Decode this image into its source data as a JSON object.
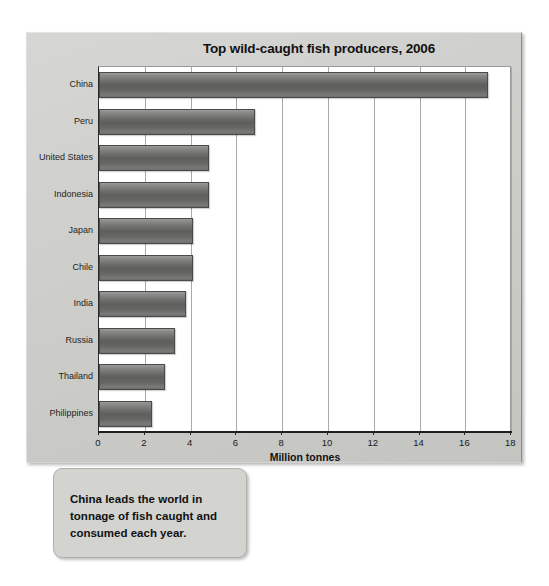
{
  "chart_data": {
    "type": "bar",
    "orientation": "horizontal",
    "title": "Top wild-caught fish producers, 2006",
    "xlabel": "Million tonnes",
    "ylabel": "",
    "xlim": [
      0,
      18
    ],
    "xticks": [
      0,
      2,
      4,
      6,
      8,
      10,
      12,
      14,
      16,
      18
    ],
    "grid": "vertical",
    "legend": "none",
    "categories": [
      "China",
      "Peru",
      "United States",
      "Indonesia",
      "Japan",
      "Chile",
      "India",
      "Russia",
      "Thailand",
      "Philippines"
    ],
    "values": [
      17.0,
      6.8,
      4.8,
      4.8,
      4.1,
      4.1,
      3.8,
      3.3,
      2.9,
      2.3
    ],
    "bar_color": "#6b6b69"
  },
  "caption": {
    "text": "China leads the world in tonnage of fish caught and consumed each year."
  }
}
